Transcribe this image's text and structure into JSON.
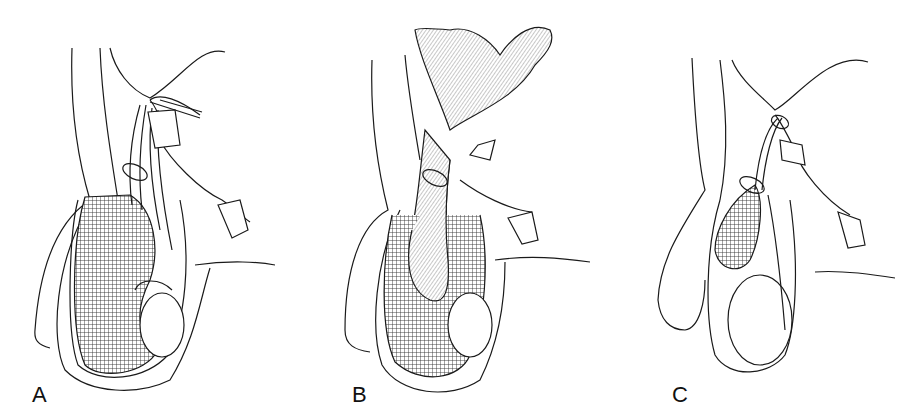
{
  "figure": {
    "panels": [
      {
        "label": "A",
        "description": "Hydrocele within tunica vaginalis with ligature around spermatic cord"
      },
      {
        "label": "B",
        "description": "Hernial sac with bowel descending into tunica vaginalis, ligature at neck"
      },
      {
        "label": "C",
        "description": "Encysted hydrocele of the cord with ligatures above and below"
      }
    ],
    "colors": {
      "line": "#1a1a1a",
      "background": "#ffffff",
      "hatch": "#333333"
    }
  }
}
